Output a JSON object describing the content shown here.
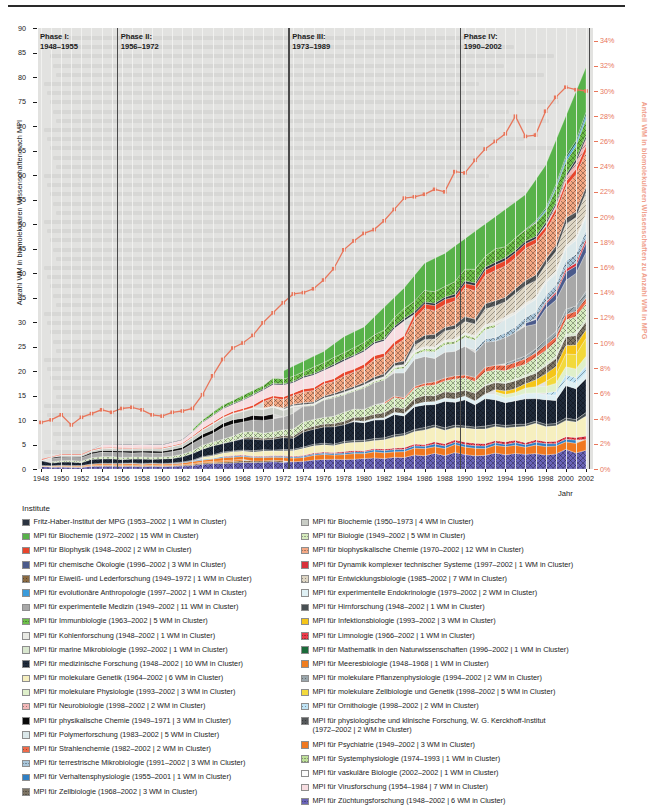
{
  "chart_data": {
    "type": "area",
    "title": "",
    "xlabel": "Jahr",
    "ylabel_left": "Anzahl WM in biomolekularen Wissenschaften nach MPI",
    "ylabel_right": "Anteil WM in biomolekularen Wissenschaften zu Anzahl WM in MPG",
    "xlim": [
      1948,
      2002
    ],
    "ylim_left": [
      0,
      90
    ],
    "ylim_right": [
      0,
      35
    ],
    "left_ticks": [
      0,
      5,
      10,
      15,
      20,
      25,
      30,
      35,
      40,
      45,
      50,
      55,
      60,
      65,
      70,
      75,
      80,
      85,
      90
    ],
    "right_ticks": [
      "0%",
      "2%",
      "4%",
      "6%",
      "8%",
      "10%",
      "12%",
      "14%",
      "16%",
      "18%",
      "20%",
      "22%",
      "24%",
      "26%",
      "28%",
      "30%",
      "32%",
      "34%"
    ],
    "x_ticks": [
      1948,
      1950,
      1952,
      1954,
      1956,
      1958,
      1960,
      1962,
      1964,
      1966,
      1968,
      1970,
      1972,
      1974,
      1976,
      1978,
      1980,
      1982,
      1984,
      1986,
      1988,
      1990,
      1992,
      1994,
      1996,
      1998,
      2000,
      2002
    ],
    "grid": true,
    "legend_position": "below",
    "line_series": {
      "name": "Anteil WM in biomolekularen Wissenschaften zu Anzahl WM in MPG",
      "color": "#e8765b",
      "x": [
        1948,
        1949,
        1950,
        1951,
        1952,
        1953,
        1954,
        1955,
        1956,
        1957,
        1958,
        1959,
        1960,
        1961,
        1962,
        1963,
        1964,
        1965,
        1966,
        1967,
        1968,
        1969,
        1970,
        1971,
        1972,
        1973,
        1974,
        1975,
        1976,
        1977,
        1978,
        1979,
        1980,
        1981,
        1982,
        1983,
        1984,
        1985,
        1986,
        1987,
        1988,
        1989,
        1990,
        1991,
        1992,
        1993,
        1994,
        1995,
        1996,
        1997,
        1998,
        1999,
        2000,
        2001,
        2002
      ],
      "values": [
        3.7,
        3.9,
        4.3,
        3.5,
        4.1,
        4.4,
        4.7,
        4.5,
        4.8,
        4.9,
        4.7,
        4.3,
        4.2,
        4.5,
        4.6,
        4.8,
        5.9,
        7.4,
        8.7,
        9.6,
        10.0,
        10.6,
        11.6,
        12.4,
        13.2,
        13.9,
        14.0,
        14.3,
        15.0,
        15.9,
        17.4,
        18.1,
        18.7,
        19.0,
        19.7,
        20.6,
        21.5,
        21.6,
        21.8,
        22.2,
        22.0,
        23.6,
        23.5,
        24.5,
        25.4,
        26.0,
        26.6,
        28.0,
        26.4,
        26.5,
        28.4,
        29.5,
        30.3,
        30.1,
        30.0
      ]
    },
    "total_series": {
      "name": "Anzahl WM in biomolekularen Wissenschaften nach MPI",
      "x": [
        1948,
        1950,
        1952,
        1954,
        1956,
        1958,
        1960,
        1962,
        1964,
        1966,
        1968,
        1970,
        1972,
        1974,
        1976,
        1978,
        1980,
        1982,
        1984,
        1986,
        1988,
        1990,
        1992,
        1994,
        1996,
        1998,
        2000,
        2002
      ],
      "values": [
        2,
        3,
        3,
        5,
        5,
        5,
        5,
        6,
        10,
        13,
        15,
        17,
        20,
        22,
        24,
        27,
        29,
        33,
        37,
        42,
        44,
        47,
        50,
        53,
        56,
        62,
        72,
        82
      ]
    }
  },
  "phases": [
    {
      "name": "Phase I:",
      "range": "1948–1955",
      "start": 1948,
      "end": 1955
    },
    {
      "name": "Phase II:",
      "range": "1956–1972",
      "start": 1956,
      "end": 1972
    },
    {
      "name": "Phase III:",
      "range": "1973–1989",
      "start": 1973,
      "end": 1989
    },
    {
      "name": "Phase IV:",
      "range": "1990–2002",
      "start": 1990,
      "end": 2002
    }
  ],
  "legend": {
    "title": "Institute",
    "left_items": [
      {
        "label": "Fritz-Haber-Institut der MPG (1953–2002 | 1 WM in Cluster)",
        "color": "#2b3340",
        "pattern": "solid"
      },
      {
        "label": "MPI für Biochemie (1972–2002 | 15 WM in Cluster)",
        "color": "#58b24a",
        "pattern": "solid"
      },
      {
        "label": "MPI für Biophysik (1948–2002 | 2 WM in Cluster)",
        "color": "#e8452c",
        "pattern": "solid"
      },
      {
        "label": "MPI für chemische Ökologie (1996–2002 | 3 WM in Cluster)",
        "color": "#4b5b8c",
        "pattern": "solid"
      },
      {
        "label": "MPI für Eiweiß- und Lederforschung (1949–1972 | 1 WM in Cluster)",
        "color": "#8a6a42",
        "pattern": "diag"
      },
      {
        "label": "MPI für evolutionäre Anthropologie (1997–2002 | 1 WM in Cluster)",
        "color": "#3a9bdb",
        "pattern": "solid"
      },
      {
        "label": "MPI für experimentelle Medizin (1949–2002 | 11 WM in Cluster)",
        "color": "#a8a8a8",
        "pattern": "solid"
      },
      {
        "label": "MPI für Immunbiologie (1963–2002 | 5 WM in Cluster)",
        "color": "#6dbf4a",
        "pattern": "cross"
      },
      {
        "label": "MPI für Kohlenforschung (1948–2002 | 1 WM in Cluster)",
        "color": "#e9eae4",
        "pattern": "solid"
      },
      {
        "label": "MPI für marine Mikrobiologie (1992–2002 | 1 WM in Cluster)",
        "color": "#d9e7cf",
        "pattern": "solid"
      },
      {
        "label": "MPI für medizinische Forschung (1948–2002 | 10 WM in Cluster)",
        "color": "#1f2a3a",
        "pattern": "cross"
      },
      {
        "label": "MPI für molekulare Genetik (1964–2002 | 6 WM in Cluster)",
        "color": "#f6efbf",
        "pattern": "solid"
      },
      {
        "label": "MPI für molekulare Physiologie (1993–2002 | 3 WM in Cluster)",
        "color": "#dff0cb",
        "pattern": "solid"
      },
      {
        "label": "MPI für Neurobiologie (1998–2002 | 2 WM in Cluster)",
        "color": "#f2b8b8",
        "pattern": "diag"
      },
      {
        "label": "MPI für physikalische Chemie (1949–1971 | 3 WM in Cluster)",
        "color": "#0a0a0a",
        "pattern": "solid"
      },
      {
        "label": "MPI für Polymerforschung (1983–2002 | 5 WM in Cluster)",
        "color": "#dbe8ea",
        "pattern": "solid"
      },
      {
        "label": "MPI für Strahlenchemie (1982–2002 | 2 WM in Cluster)",
        "color": "#ef6a4a",
        "pattern": "diag"
      },
      {
        "label": "MPI für terrestrische Mikrobiologie (1991–2002 | 3 WM in Cluster)",
        "color": "#a9c6da",
        "pattern": "cross"
      },
      {
        "label": "MPI für Verhaltensphysiologie (1955–2001 | 1 WM in Cluster)",
        "color": "#2f7fc4",
        "pattern": "solid"
      },
      {
        "label": "MPI für Zellbiologie (1968–2002 | 3 WM in Cluster)",
        "color": "#7d7464",
        "pattern": "cross"
      }
    ],
    "right_items": [
      {
        "label": "MPI für Biochemie (1950–1973 | 4 WM in Cluster)",
        "color": "#c9cdc6",
        "pattern": "solid"
      },
      {
        "label": "MPI für Biologie (1949–2002 | 5 WM in Cluster)",
        "color": "#d6ebbe",
        "pattern": "cross"
      },
      {
        "label": "MPI für biophysikalische Chemie (1970–2002 | 12 WM in Cluster)",
        "color": "#f5a985",
        "pattern": "cross"
      },
      {
        "label": "MPI für Dynamik komplexer technischer Systeme (1997–2002 | 1 WM in Cluster)",
        "color": "#d8303a",
        "pattern": "solid"
      },
      {
        "label": "MPI für Entwicklungsbiologie (1985–2002 | 7 WM in Cluster)",
        "color": "#ded6c4",
        "pattern": "diag"
      },
      {
        "label": "MPI für experimentelle Endokrinologie (1979–2002 | 2 WM in Cluster)",
        "color": "#dff0f4",
        "pattern": "solid"
      },
      {
        "label": "MPI für Hirnforschung (1948–2002 | 1 WM in Cluster)",
        "color": "#474f52",
        "pattern": "solid"
      },
      {
        "label": "MPI für Infektionsbiologie (1993–2002 | 3 WM in Cluster)",
        "color": "#f5c518",
        "pattern": "solid"
      },
      {
        "label": "MPI für Limnologie (1966–2002 | 1 WM in Cluster)",
        "color": "#ec3b4a",
        "pattern": "cross"
      },
      {
        "label": "MPI für Mathematik in den Naturwissenschaften (1996–2002 | 1 WM in Cluster)",
        "color": "#1b6b3a",
        "pattern": "solid"
      },
      {
        "label": "MPI für Meeresbiologie (1948–1968 | 1 WM in Cluster)",
        "color": "#f07d1e",
        "pattern": "solid"
      },
      {
        "label": "MPI für molekulare Pflanzenphysiologie (1994–2002 | 2 WM in Cluster)",
        "color": "#9aa6ac",
        "pattern": "diag"
      },
      {
        "label": "MPI für molekulare Zellbiologie und Genetik (1998–2002 | 5 WM in Cluster)",
        "color": "#f2d93c",
        "pattern": "solid"
      },
      {
        "label": "MPI für Ornithologie (1998–2002 | 2 WM in Cluster)",
        "color": "#bfe3f5",
        "pattern": "diag"
      },
      {
        "label": "MPI für physiologische und klinische Forschung, W. G. Kerckhoff-Institut\n(1972–2002 | 2 WM in Cluster)",
        "color": "#55585a",
        "pattern": "diag"
      },
      {
        "label": "MPI für Psychiatrie (1949–2002 | 3 WM in Cluster)",
        "color": "#f07820",
        "pattern": "solid"
      },
      {
        "label": "MPI für Systemphysiologie (1974–1993 | 1 WM in Cluster)",
        "color": "#bfe09a",
        "pattern": "cross"
      },
      {
        "label": "MPI für vaskuläre Biologie (2002–2002 | 1 WM in Cluster)",
        "color": "#fdfdfd",
        "pattern": "solid"
      },
      {
        "label": "MPI für Virusforschung (1954–1984 | 7 WM in Cluster)",
        "color": "#f7dde1",
        "pattern": "solid"
      },
      {
        "label": "MPI für Züchtungsforschung (1948–2002 | 6 WM in Cluster)",
        "color": "#6a64b8",
        "pattern": "cross"
      }
    ]
  },
  "colors": {
    "plot_background": "#e2e2e0",
    "accent_line": "#e8765b",
    "axis": "#1b1b1b"
  }
}
